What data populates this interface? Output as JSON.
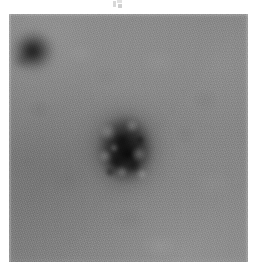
{
  "image": {
    "kind": "electron-micrograph",
    "technique": "negative-stain transmission electron microscopy",
    "caption": "",
    "background_tone_hex": "#828282",
    "particle_dark_hex": "#1e1e1e",
    "plate": {
      "left": 9,
      "top": 14,
      "width": 239,
      "height": 248
    },
    "margin_hex": "#ffffff"
  },
  "artifacts": {
    "top_mark": {
      "label": "",
      "left": 113,
      "top": 0,
      "width": 10,
      "height": 8
    }
  },
  "particles": [
    {
      "name": "upper-left-particle",
      "description": "small dark rounded particle, clipped by the left edge of the field",
      "center_x": 32,
      "center_y": 52,
      "width": 52,
      "height": 50,
      "darkness": "dark"
    },
    {
      "name": "central-particle",
      "description": "large roughly spherical virion with mottled internal capsomere structure and a darker core",
      "center_x": 125,
      "center_y": 149,
      "width": 66,
      "height": 78,
      "darkness": "very dark"
    }
  ],
  "internal_structure": {
    "light_speckles": [
      {
        "x": 16,
        "y": 22,
        "r": 11
      },
      {
        "x": 40,
        "y": 16,
        "r": 9
      },
      {
        "x": 13,
        "y": 46,
        "r": 9
      },
      {
        "x": 47,
        "y": 44,
        "r": 10
      },
      {
        "x": 30,
        "y": 62,
        "r": 8
      },
      {
        "x": 50,
        "y": 64,
        "r": 7
      },
      {
        "x": 22,
        "y": 38,
        "r": 6
      }
    ],
    "dark_speckles": [
      {
        "x": 30,
        "y": 30,
        "r": 10
      },
      {
        "x": 24,
        "y": 52,
        "r": 9
      },
      {
        "x": 42,
        "y": 56,
        "r": 9
      },
      {
        "x": 36,
        "y": 44,
        "r": 8
      },
      {
        "x": 18,
        "y": 62,
        "r": 7
      },
      {
        "x": 48,
        "y": 30,
        "r": 7
      }
    ]
  }
}
